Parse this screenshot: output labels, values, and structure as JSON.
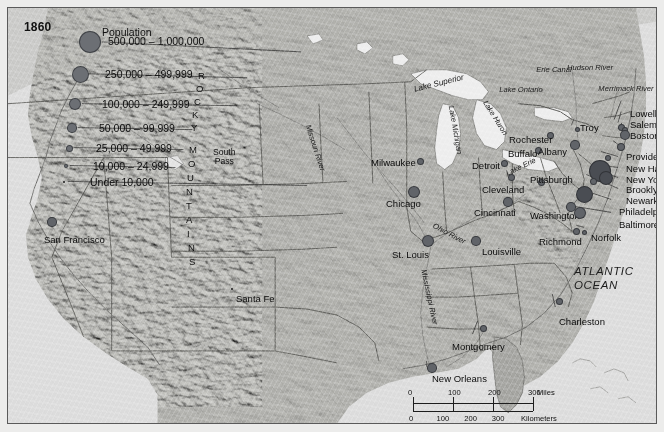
{
  "figure": {
    "year_title": "1860",
    "ocean_label": "ATLANTIC\nOCEAN",
    "ocean_label_line1": "ATLANTIC",
    "ocean_label_line2": "OCEAN"
  },
  "legend": {
    "title": "Population",
    "entries": [
      {
        "label": "500,000 – 1,000,000",
        "size": 22
      },
      {
        "label": "250,000 – 499,999",
        "size": 17
      },
      {
        "label": "100,000 – 249,999",
        "size": 12.5
      },
      {
        "label": "50,000 – 99,999",
        "size": 9.5
      },
      {
        "label": "25,000 – 49,999",
        "size": 7
      },
      {
        "label": "10,000 – 24,999",
        "size": 4.5
      },
      {
        "label": "Under 10,000",
        "size": 2.5
      }
    ]
  },
  "colors": {
    "dot": "#616469",
    "dot_dark": "#4a4d53",
    "land": "#a8a8a4",
    "water": "#dedede",
    "frame": "#5a5a5a",
    "text": "#0c0c0c"
  },
  "cities": [
    {
      "name": "San Francisco",
      "x": 44,
      "y": 214,
      "size": 9.5,
      "lx": 36,
      "ly": 226,
      "anchor": "start"
    },
    {
      "name": "Santa Fe",
      "x": 224,
      "y": 281,
      "size": 2.5,
      "lx": 228,
      "ly": 285,
      "anchor": "start"
    },
    {
      "name": "Milwaukee",
      "x": 412,
      "y": 153,
      "size": 7,
      "lx": 363,
      "ly": 149,
      "anchor": "start"
    },
    {
      "name": "Chicago",
      "x": 406,
      "y": 184,
      "size": 12.5,
      "lx": 378,
      "ly": 190,
      "anchor": "start"
    },
    {
      "name": "Detroit",
      "x": 496,
      "y": 155,
      "size": 7,
      "lx": 464,
      "ly": 152,
      "anchor": "start"
    },
    {
      "name": "Cleveland",
      "x": 503,
      "y": 169,
      "size": 7,
      "lx": 474,
      "ly": 176,
      "anchor": "start"
    },
    {
      "name": "Cincinnati",
      "x": 500,
      "y": 194,
      "size": 9.5,
      "lx": 466,
      "ly": 199,
      "anchor": "start"
    },
    {
      "name": "Pittsburgh",
      "x": 533,
      "y": 174,
      "size": 7,
      "lx": 522,
      "ly": 166,
      "anchor": "start"
    },
    {
      "name": "Buffalo",
      "x": 530,
      "y": 142,
      "size": 7,
      "lx": 500,
      "ly": 140,
      "anchor": "start"
    },
    {
      "name": "Rochester",
      "x": 542,
      "y": 127,
      "size": 7,
      "lx": 501,
      "ly": 126,
      "anchor": "start"
    },
    {
      "name": "Albany",
      "x": 567,
      "y": 137,
      "size": 9.5,
      "lx": 530,
      "ly": 138,
      "anchor": "start"
    },
    {
      "name": "Troy",
      "x": 569,
      "y": 121,
      "size": 5,
      "lx": 572,
      "ly": 114,
      "anchor": "start"
    },
    {
      "name": "Washington",
      "x": 563,
      "y": 199,
      "size": 9.5,
      "lx": 522,
      "ly": 202,
      "anchor": "start"
    },
    {
      "name": "Richmond",
      "x": 568,
      "y": 223,
      "size": 7,
      "lx": 531,
      "ly": 228,
      "anchor": "start"
    },
    {
      "name": "Norfolk",
      "x": 576,
      "y": 224,
      "size": 5,
      "lx": 583,
      "ly": 224,
      "anchor": "start"
    },
    {
      "name": "St. Louis",
      "x": 420,
      "y": 233,
      "size": 12.5,
      "lx": 384,
      "ly": 241,
      "anchor": "start"
    },
    {
      "name": "Louisville",
      "x": 468,
      "y": 233,
      "size": 9.5,
      "lx": 474,
      "ly": 238,
      "anchor": "start"
    },
    {
      "name": "Charleston",
      "x": 551,
      "y": 293,
      "size": 7,
      "lx": 551,
      "ly": 308,
      "anchor": "start"
    },
    {
      "name": "Montgomery",
      "x": 475,
      "y": 320,
      "size": 7,
      "lx": 444,
      "ly": 333,
      "anchor": "start"
    },
    {
      "name": "New Orleans",
      "x": 424,
      "y": 360,
      "size": 9.5,
      "lx": 424,
      "ly": 365,
      "anchor": "start"
    },
    {
      "name": "Lowell",
      "x": 613,
      "y": 119,
      "size": 7,
      "lx": 622,
      "ly": 100,
      "anchor": "start"
    },
    {
      "name": "Salem",
      "x": 617,
      "y": 122,
      "size": 6,
      "lx": 622,
      "ly": 111,
      "anchor": "start"
    },
    {
      "name": "Boston",
      "x": 617,
      "y": 127,
      "size": 10,
      "lx": 622,
      "ly": 122,
      "anchor": "start"
    },
    {
      "name": "Providence",
      "x": 613,
      "y": 139,
      "size": 8,
      "lx": 618,
      "ly": 143,
      "anchor": "start"
    },
    {
      "name": "New Haven",
      "x": 600,
      "y": 150,
      "size": 6,
      "lx": 618,
      "ly": 155,
      "anchor": "start"
    },
    {
      "name": "New York",
      "x": 592,
      "y": 163,
      "size": 22,
      "lx": 618,
      "ly": 166,
      "anchor": "start"
    },
    {
      "name": "Brooklyn",
      "x": 598,
      "y": 170,
      "size": 14,
      "lx": 618,
      "ly": 176,
      "anchor": "start"
    },
    {
      "name": "Newark",
      "x": 585,
      "y": 173,
      "size": 7,
      "lx": 618,
      "ly": 187,
      "anchor": "start"
    },
    {
      "name": "Philadelphia",
      "x": 576,
      "y": 186,
      "size": 17,
      "lx": 611,
      "ly": 198,
      "anchor": "start"
    },
    {
      "name": "Baltimore",
      "x": 572,
      "y": 205,
      "size": 12,
      "lx": 611,
      "ly": 211,
      "anchor": "start"
    }
  ],
  "geo_labels": [
    {
      "text": "Lake Superior",
      "x": 431,
      "y": 76,
      "rot": -14,
      "size": 8.2
    },
    {
      "text": "Lake Michigan",
      "x": 447,
      "y": 122,
      "rot": 80,
      "size": 7.6
    },
    {
      "text": "Lake Huron",
      "x": 487,
      "y": 110,
      "rot": 58,
      "size": 7.6
    },
    {
      "text": "Lake Erie",
      "x": 513,
      "y": 159,
      "rot": -26,
      "size": 7.6
    },
    {
      "text": "Lake Ontario",
      "x": 513,
      "y": 82,
      "rot": 0,
      "size": 7.6
    },
    {
      "text": "Erie Canal",
      "x": 546,
      "y": 62,
      "rot": 0,
      "size": 7.6
    },
    {
      "text": "Hudson River",
      "x": 582,
      "y": 60,
      "rot": 0,
      "size": 7.6
    },
    {
      "text": "Merrimack River",
      "x": 618,
      "y": 81,
      "rot": 0,
      "size": 7.6
    },
    {
      "text": "Missouri River",
      "x": 307,
      "y": 140,
      "rot": 72,
      "size": 7.6
    },
    {
      "text": "Mississippi River",
      "x": 421,
      "y": 289,
      "rot": 78,
      "size": 7.6
    },
    {
      "text": "Ohio River",
      "x": 441,
      "y": 226,
      "rot": 28,
      "size": 7.6
    }
  ],
  "rockies": {
    "letters": [
      "R",
      "O",
      "C",
      "K",
      "Y",
      "M",
      "O",
      "U",
      "N",
      "T",
      "A",
      "I",
      "N",
      "S"
    ],
    "pass_label_line1": "South",
    "pass_label_line2": "Pass"
  },
  "scalebar": {
    "miles_ticks": [
      "0",
      "100",
      "200",
      "300"
    ],
    "miles_unit": "Miles",
    "km_ticks": [
      "0",
      "100",
      "200",
      "300"
    ],
    "km_unit": "Kilometers"
  }
}
